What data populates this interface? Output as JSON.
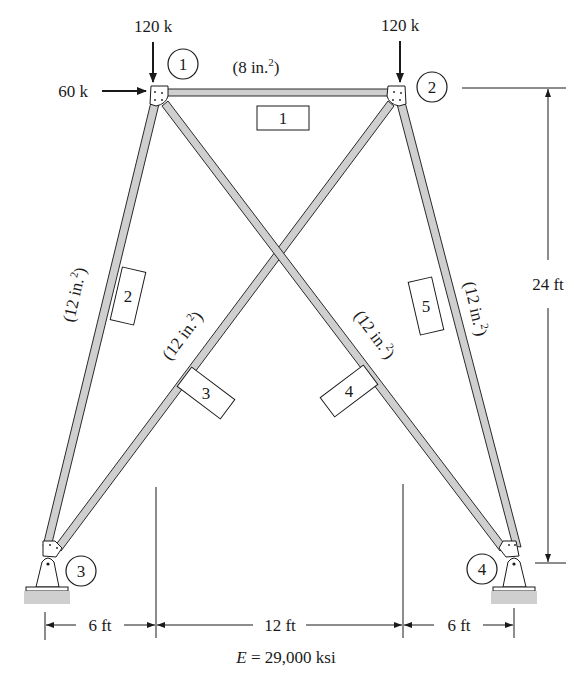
{
  "diagram": {
    "type": "plane truss",
    "nodes": [
      {
        "id": "1",
        "label": "1"
      },
      {
        "id": "2",
        "label": "2"
      },
      {
        "id": "3",
        "label": "3"
      },
      {
        "id": "4",
        "label": "4"
      }
    ],
    "members": [
      {
        "id": "1",
        "label": "1",
        "from": "1",
        "to": "2",
        "area": "(8 in.²)",
        "area_base": "(8 in.",
        "area_sup": "2",
        "area_close": ")"
      },
      {
        "id": "2",
        "label": "2",
        "from": "3",
        "to": "1",
        "area": "(12 in.²)",
        "area_base": "(12 in.",
        "area_sup": "2",
        "area_close": ")"
      },
      {
        "id": "3",
        "label": "3",
        "from": "3",
        "to": "2",
        "area": "(12 in.²)",
        "area_base": "(12 in.",
        "area_sup": "2",
        "area_close": ")"
      },
      {
        "id": "4",
        "label": "4",
        "from": "1",
        "to": "4",
        "area": "(12 in.²)",
        "area_base": "(12 in.",
        "area_sup": "2",
        "area_close": ")"
      },
      {
        "id": "5",
        "label": "5",
        "from": "4",
        "to": "2",
        "area": "(12 in.²)",
        "area_base": "(12 in.",
        "area_sup": "2",
        "area_close": ")"
      }
    ],
    "loads": [
      {
        "node": "1",
        "direction": "down",
        "label": "120 k"
      },
      {
        "node": "2",
        "direction": "down",
        "label": "120 k"
      },
      {
        "node": "1",
        "direction": "right",
        "label": "60 k"
      }
    ],
    "supports": [
      {
        "node": "3",
        "type": "pin"
      },
      {
        "node": "4",
        "type": "pin"
      }
    ],
    "dimensions": {
      "height": "24 ft",
      "bottom": [
        "6 ft",
        "12 ft",
        "6 ft"
      ]
    },
    "material": "E = 29,000 ksi",
    "material_var": "E",
    "material_rest": " = 29,000 ksi"
  }
}
